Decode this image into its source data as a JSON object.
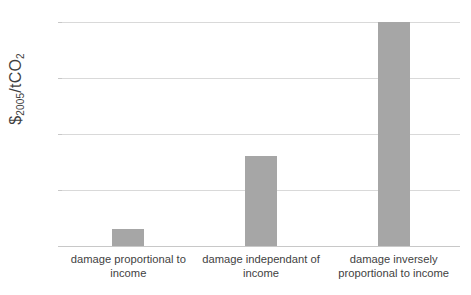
{
  "chart_data": {
    "type": "bar",
    "title": "",
    "xlabel": "",
    "ylabel": "$2005/tCO2",
    "ylabel_parts": {
      "currency": "$",
      "year_subscript": "2005",
      "unit": "/tCO",
      "unit_subscript": "2"
    },
    "categories": [
      "damage proportional to income",
      "damage independant of income",
      "damage inversely proportional to income"
    ],
    "values": [
      6,
      32,
      80
    ],
    "ylim": [
      0,
      80
    ],
    "yticks": [
      0,
      20,
      40,
      60,
      80
    ],
    "ytick_labels": [
      "0",
      "20",
      "40",
      "60",
      "80"
    ],
    "grid": true,
    "legend": "none",
    "bar_color": "#a6a6a6",
    "gridline_color": "#d9d9d9",
    "text_color": "#3f3f3f",
    "background_color": "#ffffff"
  }
}
